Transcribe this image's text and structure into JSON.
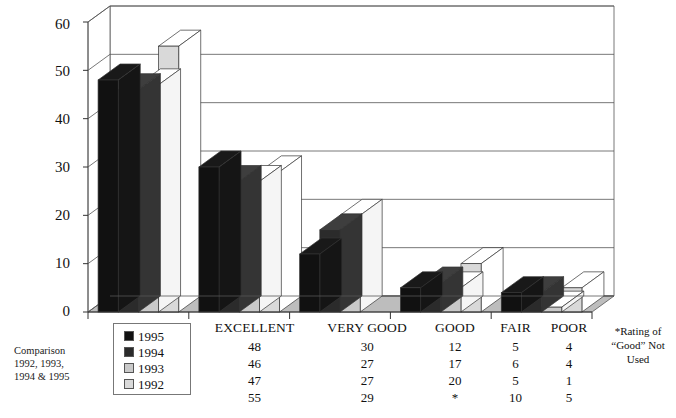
{
  "caption": {
    "line1": "Comparison",
    "line2": "1992, 1993,",
    "line3": "1994 & 1995"
  },
  "footnote": {
    "line1": "*Rating of",
    "line2": "“Good” Not",
    "line3": "Used"
  },
  "legend": {
    "items": [
      {
        "label": "1995",
        "color": "#111111"
      },
      {
        "label": "1994",
        "color": "#2b2b2b"
      },
      {
        "label": "1993",
        "color": "#c9c9c9"
      },
      {
        "label": "1992",
        "color": "#d9d9d9"
      }
    ]
  },
  "table": {
    "headers": [
      "EXCELLENT",
      "VERY GOOD",
      "GOOD",
      "FAIR",
      "POOR"
    ],
    "rows": [
      [
        "48",
        "30",
        "12",
        "5",
        "4"
      ],
      [
        "46",
        "27",
        "17",
        "6",
        "4"
      ],
      [
        "47",
        "27",
        "20",
        "5",
        "1"
      ],
      [
        "55",
        "29",
        "*",
        "10",
        "5"
      ]
    ]
  },
  "chart_data": {
    "type": "bar",
    "title": "",
    "xlabel": "",
    "ylabel": "",
    "ylim": [
      0,
      60
    ],
    "yticks": [
      0,
      10,
      20,
      30,
      40,
      50,
      60
    ],
    "grid": true,
    "legend_position": "bottom-left",
    "categories": [
      "EXCELLENT",
      "VERY GOOD",
      "GOOD",
      "FAIR",
      "POOR"
    ],
    "series": [
      {
        "name": "1995",
        "color": "#111111",
        "values": [
          48,
          30,
          12,
          5,
          4
        ]
      },
      {
        "name": "1994",
        "color": "#2b2b2b",
        "values": [
          46,
          27,
          17,
          6,
          4
        ]
      },
      {
        "name": "1993",
        "color": "#c9c9c9",
        "values": [
          47,
          27,
          20,
          5,
          1
        ]
      },
      {
        "name": "1992",
        "color": "#d9d9d9",
        "values": [
          55,
          29,
          null,
          10,
          5
        ]
      }
    ]
  }
}
